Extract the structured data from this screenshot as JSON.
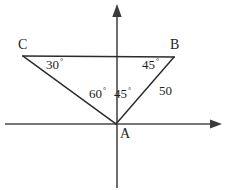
{
  "figure": {
    "background_color": "#ffffff",
    "line_color": "#2b2b2b",
    "axis_color": "#4a4a4a",
    "text_color": "#1d1d1d"
  },
  "axes": {
    "horizontal": {
      "name": "x-axis",
      "x1": 5,
      "y1": 124,
      "x2": 222,
      "y2": 124,
      "arrow": "right"
    },
    "vertical": {
      "name": "y-axis",
      "x1": 117,
      "y1": 5,
      "x2": 117,
      "y2": 188,
      "arrow": "up"
    }
  },
  "vertices": {
    "a": {
      "label": "A",
      "x": 116,
      "y": 124,
      "label_x": 120,
      "label_y": 127
    },
    "b": {
      "label": "B",
      "x": 174,
      "y": 57,
      "label_x": 170,
      "label_y": 38
    },
    "c": {
      "label": "C",
      "x": 23,
      "y": 56,
      "label_x": 18,
      "label_y": 38
    }
  },
  "edges": [
    {
      "name": "edge-ca",
      "from": "c",
      "to": "a"
    },
    {
      "name": "edge-ab",
      "from": "a",
      "to": "b"
    },
    {
      "name": "edge-cb",
      "from": "c",
      "to": "b"
    }
  ],
  "annotations": {
    "angle_c": {
      "value": "30",
      "unit": "°",
      "x": 46,
      "y": 58
    },
    "angle_b": {
      "value": "45",
      "unit": "°",
      "x": 142,
      "y": 58
    },
    "angle_cab": {
      "value": "60",
      "unit": "°",
      "x": 89,
      "y": 87
    },
    "angle_bay": {
      "value": "45",
      "unit": "°",
      "x": 114,
      "y": 87
    },
    "side_ab": {
      "value": "50",
      "unit": "",
      "x": 159,
      "y": 84
    }
  }
}
